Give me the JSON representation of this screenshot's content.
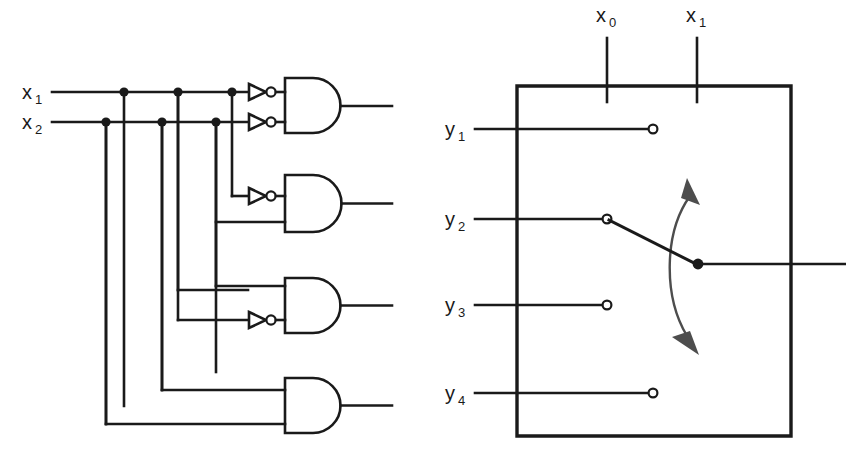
{
  "figure": {
    "title": "",
    "left_panel": {
      "name": "decoder-logic-circuit",
      "inputs": [
        {
          "id": "x1",
          "label": "x",
          "subscript": "1",
          "y": 92
        },
        {
          "id": "x2",
          "label": "x",
          "subscript": "2",
          "y": 122
        }
      ],
      "gate_type": "AND",
      "gate_count": 4,
      "gates": [
        {
          "id": "gate-1",
          "inputs_inverted": [
            true,
            true
          ],
          "top": 78,
          "bottom": 133,
          "output_y": 106
        },
        {
          "id": "gate-2",
          "inputs_inverted": [
            false,
            true
          ],
          "top": 175,
          "bottom": 232,
          "output_y": 204
        },
        {
          "id": "gate-3",
          "inputs_inverted": [
            false,
            true
          ],
          "top": 278,
          "bottom": 333,
          "output_y": 306
        },
        {
          "id": "gate-4",
          "inputs_inverted": [
            false,
            false
          ],
          "top": 378,
          "bottom": 433,
          "output_y": 406
        }
      ],
      "inverter_count": 4
    },
    "right_panel": {
      "name": "rotary-selector-switch",
      "control_inputs": [
        {
          "id": "x0",
          "label": "x",
          "subscript": "0",
          "x": 607
        },
        {
          "id": "x1",
          "label": "x",
          "subscript": "1",
          "x": 697
        }
      ],
      "contacts": [
        {
          "id": "y1",
          "label": "y",
          "subscript": "1",
          "y": 129,
          "state": "open",
          "terminal_x": 652
        },
        {
          "id": "y2",
          "label": "y",
          "subscript": "2",
          "y": 219,
          "state": "closed",
          "terminal_x": 607
        },
        {
          "id": "y3",
          "label": "y",
          "subscript": "3",
          "y": 305,
          "state": "open",
          "terminal_x": 607
        },
        {
          "id": "y4",
          "label": "y",
          "subscript": "4",
          "y": 393,
          "state": "open",
          "terminal_x": 652
        }
      ],
      "pivot": {
        "x": 698,
        "y": 264
      },
      "rotation_indicator": "double-headed-curved-arrow",
      "box": {
        "left": 517,
        "top": 86,
        "right": 791,
        "bottom": 436
      }
    },
    "colors": {
      "line": "#1a1a1a",
      "arrow": "#4d4d4d",
      "background": "#ffffff"
    }
  }
}
